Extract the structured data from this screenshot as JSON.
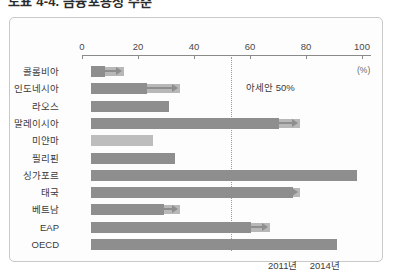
{
  "title": "도표 4-4. 금융포용성 수준",
  "axis": {
    "pct_label": "(%)",
    "ticks": [
      0,
      20,
      40,
      60,
      80,
      100
    ],
    "tick_labels": [
      "0",
      "20",
      "40",
      "60",
      "80",
      "100"
    ]
  },
  "reference": {
    "label": "아세안 50%",
    "value": 50
  },
  "legend": {
    "series_2011": "2011년",
    "series_2014": "2014년"
  },
  "chart_data": {
    "type": "bar",
    "orientation": "horizontal",
    "title": "도표 4-4. 금융포용성 수준",
    "xlabel": "(%)",
    "ylabel": "",
    "xlim": [
      0,
      100
    ],
    "grid": false,
    "legend_position": "bottom-right",
    "categories": [
      "콜롬비아",
      "인도네시아",
      "라오스",
      "말레이시아",
      "미얀마",
      "필리핀",
      "싱가포르",
      "태국",
      "베트남",
      "EAP",
      "OECD"
    ],
    "series": [
      {
        "name": "2011년",
        "values": [
          5,
          20,
          28,
          67,
          0,
          30,
          95,
          72,
          26,
          57,
          88
        ]
      },
      {
        "name": "2014년",
        "values": [
          15,
          35,
          28,
          78,
          22,
          32,
          97,
          78,
          35,
          67,
          91
        ]
      }
    ],
    "annotations": [
      {
        "text": "아세안 50%",
        "value": 50,
        "type": "reference-line"
      }
    ]
  },
  "bars": [
    {
      "category": "콜롬비아",
      "base": 5,
      "ext": 15,
      "arrow": true,
      "light_only": false
    },
    {
      "category": "인도네시아",
      "base": 20,
      "ext": 35,
      "arrow": true,
      "light_only": false
    },
    {
      "category": "라오스",
      "base": 28,
      "ext": 28,
      "arrow": false,
      "light_only": false
    },
    {
      "category": "말레이시아",
      "base": 67,
      "ext": 78,
      "arrow": true,
      "light_only": false
    },
    {
      "category": "미얀마",
      "base": 22,
      "ext": 22,
      "arrow": false,
      "light_only": true
    },
    {
      "category": "필리핀",
      "base": 30,
      "ext": 32,
      "arrow": false,
      "light_only": false
    },
    {
      "category": "싱가포르",
      "base": 95,
      "ext": 97,
      "arrow": false,
      "light_only": false
    },
    {
      "category": "태국",
      "base": 72,
      "ext": 78,
      "arrow": true,
      "light_only": false
    },
    {
      "category": "베트남",
      "base": 26,
      "ext": 35,
      "arrow": true,
      "light_only": false
    },
    {
      "category": "EAP",
      "base": 57,
      "ext": 67,
      "arrow": true,
      "light_only": false
    },
    {
      "category": "OECD",
      "base": 88,
      "ext": 91,
      "arrow": true,
      "light_only": false
    }
  ]
}
